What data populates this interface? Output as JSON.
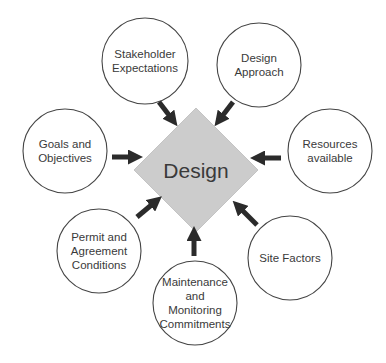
{
  "diagram": {
    "type": "hub-and-spoke",
    "colors": {
      "background": "#ffffff",
      "center_fill": "#cccccc",
      "circle_stroke": "#444444",
      "arrow": "#2b2b2b",
      "text": "#3a3a3a"
    },
    "center": {
      "label": "Design",
      "shape": "diamond",
      "x": 196,
      "y": 170,
      "half": 62
    },
    "nodes": [
      {
        "id": "stakeholder",
        "lines": [
          "Stakeholder",
          "Expectations"
        ],
        "cx": 145,
        "cy": 61,
        "r": 43,
        "arrow": {
          "x1": 159,
          "y1": 102,
          "x2": 172,
          "y2": 119
        }
      },
      {
        "id": "design-approach",
        "lines": [
          "Design",
          "Approach"
        ],
        "cx": 259,
        "cy": 65,
        "r": 42,
        "arrow": {
          "x1": 233,
          "y1": 102,
          "x2": 220,
          "y2": 119
        }
      },
      {
        "id": "resources",
        "lines": [
          "Resources",
          "available"
        ],
        "cx": 330,
        "cy": 151,
        "r": 42,
        "arrow": {
          "x1": 281,
          "y1": 158,
          "x2": 259,
          "y2": 158
        }
      },
      {
        "id": "site-factors",
        "lines": [
          "Site Factors"
        ],
        "cx": 290,
        "cy": 258,
        "r": 42,
        "arrow": {
          "x1": 257,
          "y1": 225,
          "x2": 239,
          "y2": 207
        }
      },
      {
        "id": "maintenance",
        "lines": [
          "Maintenance",
          "and",
          "Monitoring",
          "Commitments"
        ],
        "cx": 195,
        "cy": 303,
        "r": 42,
        "arrow": {
          "x1": 194,
          "y1": 256,
          "x2": 194,
          "y2": 235
        }
      },
      {
        "id": "permit",
        "lines": [
          "Permit and",
          "Agreement",
          "Conditions"
        ],
        "cx": 99,
        "cy": 251,
        "r": 42,
        "arrow": {
          "x1": 137,
          "y1": 217,
          "x2": 155,
          "y2": 202
        }
      },
      {
        "id": "goals",
        "lines": [
          "Goals and",
          "Objectives"
        ],
        "cx": 65,
        "cy": 151,
        "r": 42,
        "arrow": {
          "x1": 112,
          "y1": 157,
          "x2": 134,
          "y2": 157
        }
      }
    ]
  }
}
